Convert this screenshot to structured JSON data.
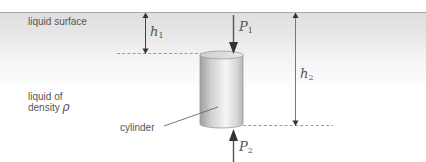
{
  "diagram": {
    "title": "",
    "labels": {
      "liquid_surface": "liquid surface",
      "liquid_line1": "liquid of",
      "liquid_line2": "density",
      "density_symbol": "ρ",
      "cylinder": "cylinder"
    },
    "symbols": {
      "h1": {
        "base": "h",
        "sub": "1"
      },
      "h2": {
        "base": "h",
        "sub": "2"
      },
      "P1": {
        "base": "P",
        "sub": "1"
      },
      "P2": {
        "base": "P",
        "sub": "2"
      }
    },
    "colors": {
      "liquid_top": "#d9d9d9",
      "liquid_fade": "#ffffff",
      "surface_line": "#a8a8a8",
      "arrow": "#555555",
      "dashed": "#9a9a9a",
      "cylinder_dark": "#a9a9a9",
      "cylinder_light": "#f4f4f4",
      "text": "#555555"
    }
  }
}
